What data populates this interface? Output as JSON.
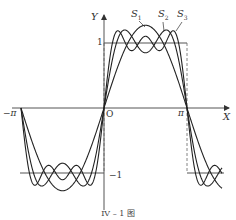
{
  "chart_data": {
    "type": "line",
    "title": "",
    "caption": "IV – 1 图",
    "xlabel": "X",
    "ylabel": "Y",
    "x_ticks": [
      "−π",
      "O",
      "π"
    ],
    "y_ticks": [
      "1",
      "−1"
    ],
    "xlim": [
      -3.14159,
      3.9
    ],
    "ylim": [
      -1.4,
      1.35
    ],
    "grid": false,
    "legend": "inline labels with arrows",
    "series": [
      {
        "name": "f(x) square wave",
        "description": "f(x)=1 for 0<x<π, −1 for −π<x<0",
        "style": "solid with dashed verticals at 0, ±π"
      },
      {
        "name": "S1",
        "formula": "(4/π) sin x"
      },
      {
        "name": "S2",
        "formula": "(4/π)(sin x + sin 3x / 3)"
      },
      {
        "name": "S3",
        "formula": "(4/π)(sin x + sin 3x / 3 + sin 5x / 5)"
      }
    ]
  },
  "labels": {
    "y_axis": "Y",
    "x_axis": "X",
    "origin": "O",
    "pi": "π",
    "neg_pi": "−π",
    "one": "1",
    "neg_one": "−1",
    "s1": "S",
    "s1_sub": "1",
    "s2": "S",
    "s2_sub": "2",
    "s3": "S",
    "s3_sub": "3",
    "caption": "IV – 1 图"
  }
}
